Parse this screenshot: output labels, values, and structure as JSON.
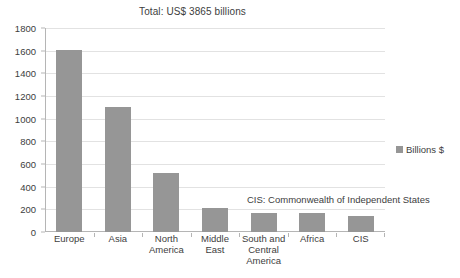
{
  "chart_data": {
    "type": "bar",
    "title": "Total: US$ 3865 billions",
    "xlabel": "",
    "ylabel": "",
    "ylim": [
      0,
      1800
    ],
    "ytick_step": 200,
    "yticks": [
      0,
      200,
      400,
      600,
      800,
      1000,
      1200,
      1400,
      1600,
      1800
    ],
    "grid": true,
    "grid_axis": "y",
    "legend_position": "right",
    "categories": [
      "Europe",
      "Asia",
      "North America",
      "Middle East",
      "South and Central America",
      "Africa",
      "CIS"
    ],
    "category_lines": [
      [
        "Europe"
      ],
      [
        "Asia"
      ],
      [
        "North",
        "America"
      ],
      [
        "Middle",
        "East"
      ],
      [
        "South and",
        "Central",
        "America"
      ],
      [
        "Africa"
      ],
      [
        "CIS"
      ]
    ],
    "series": [
      {
        "name": "Billions $",
        "color": "#969696",
        "values": [
          1610,
          1100,
          520,
          215,
          165,
          165,
          145
        ]
      }
    ],
    "annotations": [
      "CIS: Commonwealth of Independent States"
    ]
  },
  "legend": {
    "entries": [
      {
        "label": "Billions $",
        "color": "#969696"
      }
    ]
  },
  "colors": {
    "bar": "#969696",
    "gridline": "#e2e2e2",
    "axis": "#b5b5b5",
    "text": "#404040",
    "background": "#ffffff"
  }
}
